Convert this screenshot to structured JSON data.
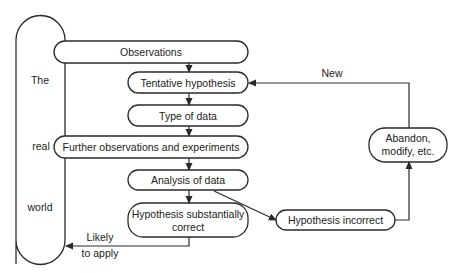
{
  "diagram": {
    "type": "flowchart",
    "colors": {
      "stroke": "#2a2a2a",
      "text": "#222222",
      "background": "#ffffff"
    },
    "side_label": {
      "line1": "The",
      "line2": "real",
      "line3": "world"
    },
    "nodes": {
      "observations": "Observations",
      "tentative_hypothesis": "Tentative hypothesis",
      "type_of_data": "Type of data",
      "further_observations": "Further observations and experiments",
      "analysis_of_data": "Analysis of data",
      "hypothesis_correct_line1": "Hypothesis substantially",
      "hypothesis_correct_line2": "correct",
      "hypothesis_incorrect": "Hypothesis incorrect",
      "abandon_line1": "Abandon,",
      "abandon_line2": "modify, etc."
    },
    "edge_labels": {
      "new": "New",
      "likely_line1": "Likely",
      "likely_line2": "to apply"
    },
    "edges": [
      {
        "from": "observations",
        "to": "tentative_hypothesis"
      },
      {
        "from": "tentative_hypothesis",
        "to": "type_of_data"
      },
      {
        "from": "type_of_data",
        "to": "further_observations"
      },
      {
        "from": "further_observations",
        "to": "analysis_of_data"
      },
      {
        "from": "analysis_of_data",
        "to": "hypothesis_correct"
      },
      {
        "from": "analysis_of_data",
        "to": "hypothesis_incorrect"
      },
      {
        "from": "hypothesis_incorrect",
        "to": "abandon"
      },
      {
        "from": "abandon",
        "to": "tentative_hypothesis",
        "label": "New"
      },
      {
        "from": "hypothesis_correct",
        "to": "real_world",
        "label": "Likely to apply"
      }
    ]
  }
}
